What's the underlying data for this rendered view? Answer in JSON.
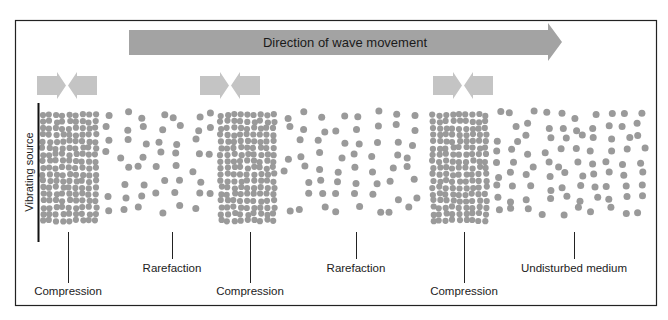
{
  "diagram": {
    "title_arrow_label": "Direction of wave movement",
    "vertical_label": "Vibrating source",
    "labels": [
      {
        "text": "Compression",
        "x": 68,
        "y": 295,
        "line_x": 68,
        "line_top": 232,
        "line_bottom": 283
      },
      {
        "text": "Rarefaction",
        "x": 172,
        "y": 272,
        "line_x": 172,
        "line_top": 232,
        "line_bottom": 259
      },
      {
        "text": "Compression",
        "x": 250,
        "y": 295,
        "line_x": 250,
        "line_top": 232,
        "line_bottom": 283
      },
      {
        "text": "Rarefaction",
        "x": 356,
        "y": 272,
        "line_x": 356,
        "line_top": 232,
        "line_bottom": 259
      },
      {
        "text": "Compression",
        "x": 464,
        "y": 295,
        "line_x": 464,
        "line_top": 232,
        "line_bottom": 283
      },
      {
        "text": "Undisturbed medium",
        "x": 574,
        "y": 272,
        "line_x": 574,
        "line_top": 232,
        "line_bottom": 259
      }
    ],
    "compression_zones": [
      {
        "x0": 40,
        "x1": 100
      },
      {
        "x0": 218,
        "x1": 280
      },
      {
        "x0": 430,
        "x1": 492
      }
    ],
    "compression_arrow_pairs_center_x": [
      67,
      230,
      463
    ],
    "colors": {
      "dot": "#9a9a9a",
      "big_arrow": "#a3a3a3",
      "small_arrow": "#c4c4c4",
      "frame": "#222222"
    }
  }
}
